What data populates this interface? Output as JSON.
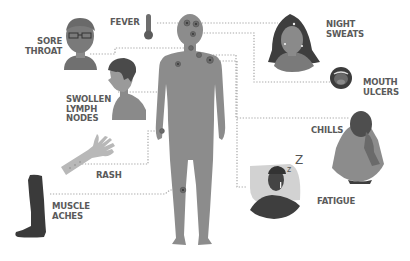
{
  "colors": {
    "body": "#8c8c8c",
    "label_text": "#5a5a5a",
    "connector": "#a8a8a8",
    "dark_figure": "#3c3c3c",
    "mid_figure": "#7a7a7a",
    "light_figure": "#b5b5b5"
  },
  "symptoms": [
    {
      "id": "fever",
      "label": "FEVER",
      "icon": "thermometer-icon"
    },
    {
      "id": "sore-throat",
      "label": "SORE\nTHROAT",
      "icon": "man-with-glasses-icon"
    },
    {
      "id": "swollen-lymph-nodes",
      "label": "SWOLLEN\nLYMPH\nNODES",
      "icon": "boy-profile-icon"
    },
    {
      "id": "rash",
      "label": "RASH",
      "icon": "arm-with-rash-icon"
    },
    {
      "id": "muscle-aches",
      "label": "MUSCLE\nACHES",
      "icon": "leg-icon"
    },
    {
      "id": "night-sweats",
      "label": "NIGHT\nSWEATS",
      "icon": "sweating-woman-icon"
    },
    {
      "id": "mouth-ulcers",
      "label": "MOUTH\nULCERS",
      "icon": "open-mouth-icon"
    },
    {
      "id": "chills",
      "label": "CHILLS",
      "icon": "woman-wrapped-in-blanket-icon"
    },
    {
      "id": "fatigue",
      "label": "FATIGUE",
      "icon": "sleeping-man-icon"
    }
  ],
  "decorations": {
    "sleep_z_small": "z",
    "sleep_z_large": "Z"
  }
}
